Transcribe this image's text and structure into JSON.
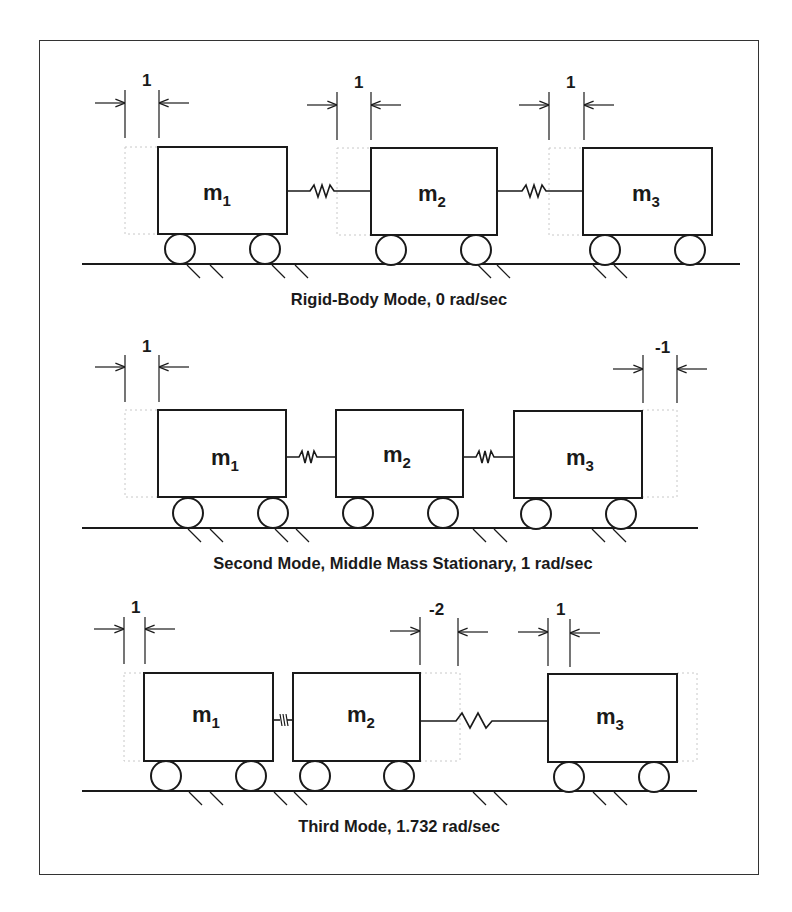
{
  "figure": {
    "rows": [
      {
        "caption": "Rigid-Body Mode, 0 rad/sec",
        "masses": [
          {
            "name": "m",
            "sub": "1"
          },
          {
            "name": "m",
            "sub": "2"
          },
          {
            "name": "m",
            "sub": "3"
          }
        ],
        "displacements": [
          "1",
          "1",
          "1"
        ]
      },
      {
        "caption": "Second Mode, Middle Mass Stationary, 1 rad/sec",
        "masses": [
          {
            "name": "m",
            "sub": "1"
          },
          {
            "name": "m",
            "sub": "2"
          },
          {
            "name": "m",
            "sub": "3"
          }
        ],
        "displacements": [
          "1",
          "-1"
        ]
      },
      {
        "caption": "Third Mode, 1.732 rad/sec",
        "masses": [
          {
            "name": "m",
            "sub": "1"
          },
          {
            "name": "m",
            "sub": "2"
          },
          {
            "name": "m",
            "sub": "3"
          }
        ],
        "displacements": [
          "1",
          "-2",
          "1"
        ]
      }
    ],
    "colors": {
      "ink": "#1a1a1a",
      "ghost": "#c8c8c8",
      "background": "#ffffff",
      "frame": "#333333"
    }
  }
}
